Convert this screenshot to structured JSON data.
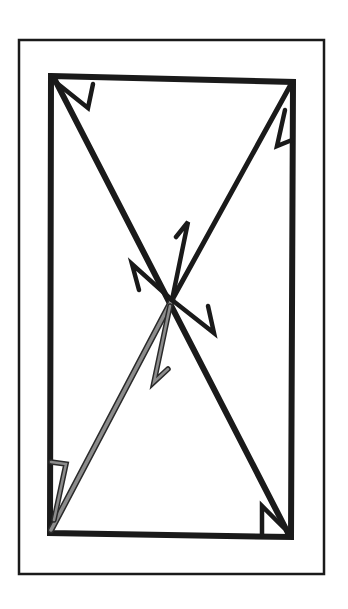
{
  "diagram": {
    "type": "rectangle-with-diagonals",
    "colors": {
      "background": "#ffffff",
      "stroke": "#1a1a1a",
      "highlight": "#8c8c8c",
      "highlight_outline": "#2a2a2a"
    },
    "frame": {
      "x": 19,
      "y": 40,
      "width": 305,
      "height": 534,
      "stroke_width": 2.5
    },
    "rectangle": {
      "corners": {
        "top_left": [
          51,
          76
        ],
        "top_right": [
          293,
          82
        ],
        "bottom_right": [
          291,
          537
        ],
        "bottom_left": [
          50,
          533
        ]
      },
      "stroke_width": 6
    },
    "intersection": [
      172,
      300
    ],
    "diagonals": [
      {
        "name": "top-left-to-bottom-right",
        "from": [
          55,
          80
        ],
        "to": [
          288,
          533
        ],
        "color": "stroke",
        "stroke_width": 6
      },
      {
        "name": "top-right-to-center",
        "from": [
          290,
          86
        ],
        "to": [
          172,
          300
        ],
        "color": "stroke",
        "stroke_width": 5
      },
      {
        "name": "center-to-bottom-left",
        "from": [
          172,
          300
        ],
        "to": [
          51,
          530
        ],
        "color": "highlight",
        "stroke_width": 5
      }
    ],
    "angle_marks": [
      {
        "name": "top-left-mark",
        "points": [
          [
            58,
            84
          ],
          [
            88,
            108
          ],
          [
            93,
            84
          ]
        ],
        "color": "stroke"
      },
      {
        "name": "top-right-mark",
        "points": [
          [
            285,
            110
          ],
          [
            277,
            146
          ],
          [
            292,
            140
          ]
        ],
        "color": "stroke"
      },
      {
        "name": "bottom-right-mark",
        "points": [
          [
            262,
            535
          ],
          [
            262,
            506
          ],
          [
            284,
            528
          ]
        ],
        "color": "stroke"
      },
      {
        "name": "bottom-left-mark",
        "points": [
          [
            51,
            462
          ],
          [
            66,
            464
          ],
          [
            54,
            520
          ]
        ],
        "color": "highlight"
      },
      {
        "name": "center-top-mark",
        "points": [
          [
            172,
            300
          ],
          [
            188,
            222
          ],
          [
            176,
            237
          ]
        ],
        "color": "stroke"
      },
      {
        "name": "center-left-mark",
        "points": [
          [
            172,
            300
          ],
          [
            132,
            264
          ],
          [
            139,
            290
          ]
        ],
        "color": "stroke"
      },
      {
        "name": "center-right-mark",
        "points": [
          [
            172,
            300
          ],
          [
            214,
            333
          ],
          [
            208,
            306
          ]
        ],
        "color": "stroke"
      },
      {
        "name": "center-bottom-mark",
        "points": [
          [
            170,
            306
          ],
          [
            154,
            382
          ],
          [
            168,
            369
          ]
        ],
        "color": "highlight"
      }
    ]
  }
}
